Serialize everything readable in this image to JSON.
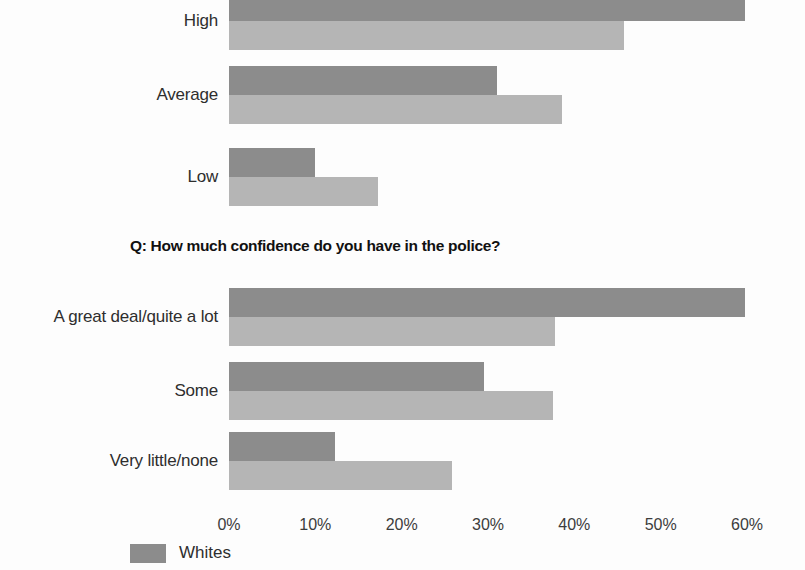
{
  "chart_data": [
    {
      "type": "bar",
      "orientation": "horizontal",
      "title": "",
      "categories": [
        "High",
        "Average",
        "Low"
      ],
      "series": [
        {
          "name": "Whites",
          "color": "#8c8c8c",
          "values": [
            59.8,
            31.0,
            10.0
          ]
        },
        {
          "name": "Blacks",
          "color": "#b5b5b5",
          "values": [
            45.8,
            38.6,
            17.3
          ]
        }
      ],
      "xlabel": "",
      "ylabel": "",
      "xlim": [
        0,
        60
      ],
      "grid": false,
      "note": "Top chart is cropped at the image top edge; its title and upper bar are cut off."
    },
    {
      "type": "bar",
      "orientation": "horizontal",
      "title": "Q: How much confidence do you have in the police?",
      "categories": [
        "A great deal/quite a lot",
        "Some",
        "Very little/none"
      ],
      "series": [
        {
          "name": "Whites",
          "color": "#8c8c8c",
          "values": [
            59.8,
            29.5,
            12.3
          ]
        },
        {
          "name": "Blacks",
          "color": "#b5b5b5",
          "values": [
            37.8,
            37.5,
            25.8
          ]
        }
      ],
      "xlabel": "",
      "ylabel": "",
      "xlim": [
        0,
        60
      ],
      "grid": false,
      "tick_labels": [
        "0%",
        "10%",
        "20%",
        "30%",
        "40%",
        "50%",
        "60%"
      ],
      "tick_values": [
        0,
        10,
        20,
        30,
        40,
        50,
        60
      ]
    }
  ],
  "chart_top": {
    "rows": [
      {
        "label": "High",
        "dark": 59.8,
        "light": 45.8
      },
      {
        "label": "Average",
        "dark": 31.0,
        "light": 38.6
      },
      {
        "label": "Low",
        "dark": 10.0,
        "light": 17.3
      }
    ]
  },
  "chart_bottom": {
    "title": "Q: How much confidence do you have in the police?",
    "rows": [
      {
        "label": "A great deal/quite a lot",
        "dark": 59.8,
        "light": 37.8
      },
      {
        "label": "Some",
        "dark": 29.5,
        "light": 37.5
      },
      {
        "label": "Very little/none",
        "dark": 12.3,
        "light": 25.8
      }
    ]
  },
  "axis": {
    "ticks": [
      {
        "label": "0%",
        "value": 0
      },
      {
        "label": "10%",
        "value": 10
      },
      {
        "label": "20%",
        "value": 20
      },
      {
        "label": "30%",
        "value": 30
      },
      {
        "label": "40%",
        "value": 40
      },
      {
        "label": "50%",
        "value": 50
      },
      {
        "label": "60%",
        "value": 60
      }
    ]
  },
  "legend": {
    "items": [
      {
        "label": "Whites",
        "color": "#8c8c8c"
      }
    ]
  },
  "colors": {
    "whites_bar": "#8c8c8c",
    "blacks_bar": "#b5b5b5",
    "text": "#2e2e2e",
    "background": "#fdfdfd"
  }
}
